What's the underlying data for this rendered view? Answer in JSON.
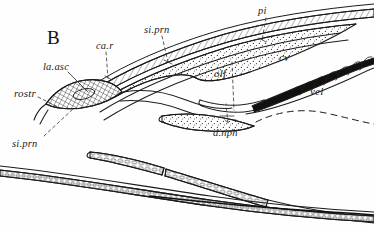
{
  "figure": {
    "panel_label": "B",
    "type": "anatomical-line-drawing",
    "background_color": "#fefefe",
    "ink_color": "#1b1b1b"
  },
  "labels": [
    {
      "id": "ca-r",
      "text": "ca.r",
      "x": 96,
      "y": 41,
      "size": 10.5
    },
    {
      "id": "si-prn-upper",
      "text": "si.prn",
      "x": 144,
      "y": 25,
      "size": 10.5
    },
    {
      "id": "pi",
      "text": "pi",
      "x": 258,
      "y": 6,
      "size": 10.5
    },
    {
      "id": "cv",
      "text": "cv",
      "x": 279,
      "y": 52,
      "size": 11
    },
    {
      "id": "la-asc",
      "text": "la.asc",
      "x": 43,
      "y": 62,
      "size": 10.5
    },
    {
      "id": "olf",
      "text": "olf",
      "x": 214,
      "y": 68,
      "size": 11
    },
    {
      "id": "vel",
      "text": "vel",
      "x": 310,
      "y": 86,
      "size": 11
    },
    {
      "id": "rostr",
      "text": "rostr",
      "x": 14,
      "y": 88,
      "size": 11
    },
    {
      "id": "si-prn-lower",
      "text": "si.prn",
      "x": 12,
      "y": 139,
      "size": 10.5
    },
    {
      "id": "d-nph",
      "text": "d.nph",
      "x": 213,
      "y": 128,
      "size": 10.5
    }
  ],
  "structures": [
    {
      "id": "dorsal-band",
      "name": "dorsal notochordal band",
      "texture": "hatched"
    },
    {
      "id": "stippled-band",
      "name": "stippled mesodermal band",
      "texture": "stipple"
    },
    {
      "id": "rostrum-band",
      "name": "rostrum",
      "texture": "crosshatch"
    },
    {
      "id": "olfactory-pit",
      "name": "olfactory pit",
      "texture": "outline"
    },
    {
      "id": "velar-tentacles",
      "name": "velar tentacles",
      "texture": "solid-fringe"
    },
    {
      "id": "lower-band",
      "name": "ventral cellular band",
      "texture": "cellular"
    },
    {
      "id": "bottom-band",
      "name": "ventral notochord band",
      "texture": "cellular"
    },
    {
      "id": "nephridium-duct",
      "name": "duct of nephridium",
      "texture": "outline"
    }
  ],
  "leaders": [
    {
      "id": "leader-ca-r",
      "from": "ca.r",
      "style": "dashed"
    },
    {
      "id": "leader-si-prn-upper",
      "from": "si.prn",
      "style": "dashed"
    },
    {
      "id": "leader-pi",
      "from": "pi",
      "style": "dashed"
    },
    {
      "id": "leader-la-asc",
      "from": "la.asc",
      "style": "solid"
    },
    {
      "id": "leader-rostr",
      "from": "rostr",
      "style": "dashed"
    },
    {
      "id": "leader-si-prn-lower",
      "from": "si.prn",
      "style": "dashed"
    },
    {
      "id": "leader-olf",
      "from": "olf",
      "style": "dashed"
    },
    {
      "id": "leader-d-nph",
      "from": "d.nph",
      "style": "dashed"
    }
  ]
}
